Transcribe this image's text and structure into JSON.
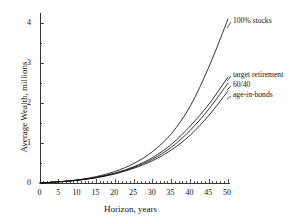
{
  "chart_data": {
    "type": "line",
    "title": "",
    "xlabel": "Horizon, years",
    "ylabel": "Average Wealth, millions",
    "xlim": [
      0,
      50
    ],
    "ylim": [
      0,
      4.3
    ],
    "xticks": [
      0,
      5,
      10,
      15,
      20,
      25,
      30,
      35,
      40,
      45,
      50
    ],
    "yticks": [
      0,
      1,
      2,
      3,
      4
    ],
    "xtick_labels": [
      "0",
      "5",
      "10",
      "15",
      "20",
      "25",
      "30",
      "35",
      "40",
      "45",
      "50"
    ],
    "ytick_labels": [
      "0",
      "1",
      "2",
      "3",
      "4"
    ],
    "minor_xticks": true,
    "minor_yticks": true,
    "grid": false,
    "legend": "inline-annotations",
    "x": [
      0,
      5,
      10,
      15,
      20,
      25,
      30,
      35,
      40,
      45,
      50
    ],
    "series": [
      {
        "name": "100% stocks",
        "label": "100% stocks",
        "color": "#111111",
        "values": [
          0.0,
          0.03,
          0.08,
          0.16,
          0.29,
          0.49,
          0.79,
          1.24,
          1.93,
          2.92,
          4.1
        ]
      },
      {
        "name": "target retirement",
        "label": "target retirement",
        "color": "#111111",
        "values": [
          0.0,
          0.03,
          0.07,
          0.14,
          0.25,
          0.41,
          0.64,
          0.97,
          1.43,
          1.98,
          2.65
        ]
      },
      {
        "name": "60/40",
        "label": "60/40",
        "color": "#111111",
        "values": [
          0.0,
          0.03,
          0.07,
          0.14,
          0.24,
          0.39,
          0.6,
          0.9,
          1.32,
          1.86,
          2.5
        ]
      },
      {
        "name": "age-in-bonds",
        "label": "age-in-bonds",
        "color": "#111111",
        "values": [
          0.0,
          0.03,
          0.07,
          0.13,
          0.23,
          0.37,
          0.56,
          0.83,
          1.2,
          1.7,
          2.3
        ]
      }
    ],
    "annotations": [
      {
        "text": "100% stocks",
        "x": 50,
        "y": 4.05
      },
      {
        "text": "target retirement",
        "x": 50,
        "y": 2.73
      },
      {
        "text": "60/40",
        "x": 50,
        "y": 2.42
      },
      {
        "text": "age-in-bonds",
        "x": 50,
        "y": 2.1
      }
    ]
  }
}
